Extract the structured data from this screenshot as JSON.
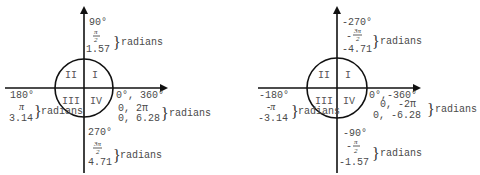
{
  "diagrams": [
    {
      "name": "positive-angles",
      "quadrants": [
        "I",
        "II",
        "III",
        "IV"
      ],
      "top": {
        "degrees": "90°",
        "frac_num": "π",
        "frac_den": "2",
        "decimal": "1.57",
        "unit": "radians"
      },
      "left": {
        "degrees": "180°",
        "symbol": "π",
        "decimal": "3.14",
        "unit": "radians"
      },
      "right": {
        "degrees": "0°, 360°",
        "line1": "0, 2π",
        "line2": "0, 6.28",
        "unit": "radians"
      },
      "bottom": {
        "degrees": "270°",
        "frac_num": "3π",
        "frac_den": "2",
        "decimal": "4.71",
        "unit": "radians"
      }
    },
    {
      "name": "negative-angles",
      "quadrants": [
        "I",
        "II",
        "III",
        "IV"
      ],
      "top": {
        "degrees": "-270°",
        "sign": "-",
        "frac_num": "3π",
        "frac_den": "2",
        "decimal": "-4.71",
        "unit": "radians"
      },
      "left": {
        "degrees": "-180°",
        "symbol": "-π",
        "decimal": "-3.14",
        "unit": "radians"
      },
      "right": {
        "degrees": "0°,-360°",
        "line1": "0, -2π",
        "line2": "0, -6.28",
        "unit": "radians"
      },
      "bottom": {
        "degrees": "-90°",
        "sign": "-",
        "frac_num": "π",
        "frac_den": "2",
        "decimal": "-1.57",
        "unit": "radians"
      }
    }
  ],
  "brace_glyph": "}"
}
